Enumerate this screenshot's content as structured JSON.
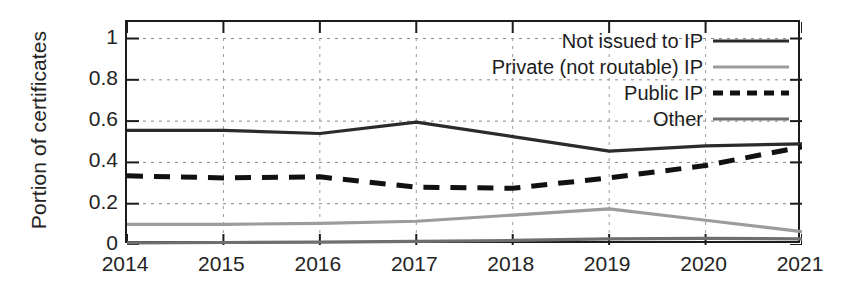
{
  "chart_data": {
    "type": "line",
    "title": "",
    "xlabel": "",
    "ylabel": "Portion of certificates",
    "x": [
      2014,
      2015,
      2016,
      2017,
      2018,
      2019,
      2020,
      2021
    ],
    "xtick_labels": [
      "2014",
      "2015",
      "2016",
      "2017",
      "2018",
      "2019",
      "2020",
      "2021"
    ],
    "ytick_labels": [
      "1",
      "0.8",
      "0.6",
      "0.4",
      "0.2",
      "0"
    ],
    "ytick_values": [
      1,
      0.8,
      0.6,
      0.4,
      0.2,
      0
    ],
    "ylim": [
      0,
      1.08
    ],
    "xlim": [
      2014,
      2021
    ],
    "grid": true,
    "legend_position": "upper right (inside axes)",
    "series": [
      {
        "name": "Not issued to IP",
        "style": "solid",
        "color": "#2b2b2b",
        "values": [
          0.555,
          0.555,
          0.54,
          0.595,
          0.525,
          0.455,
          0.48,
          0.49
        ]
      },
      {
        "name": "Private (not routable) IP",
        "style": "solid",
        "color": "#9c9c9c",
        "values": [
          0.1,
          0.1,
          0.105,
          0.115,
          0.145,
          0.175,
          0.12,
          0.065
        ]
      },
      {
        "name": "Public IP",
        "style": "dashed",
        "color": "#111111",
        "values": [
          0.335,
          0.325,
          0.33,
          0.28,
          0.275,
          0.325,
          0.385,
          0.475
        ]
      },
      {
        "name": "Other",
        "style": "solid",
        "color": "#6f6f6f",
        "values": [
          0.01,
          0.012,
          0.014,
          0.018,
          0.022,
          0.03,
          0.032,
          0.03
        ]
      }
    ]
  },
  "legend": {
    "items": [
      {
        "label": "Not issued to IP"
      },
      {
        "label": "Private (not routable) IP"
      },
      {
        "label": "Public IP"
      },
      {
        "label": "Other"
      }
    ]
  }
}
